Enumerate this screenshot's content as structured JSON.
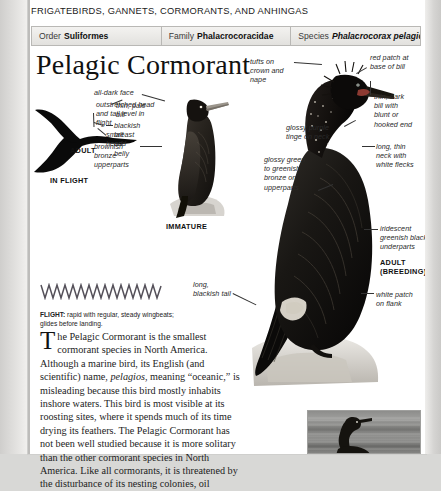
{
  "page": {
    "running_head": "FRIGATEBIRDS, GANNETS, CORMORANTS, AND ANHINGAS",
    "title": "Pelagic Cormorant"
  },
  "taxonomy": [
    {
      "label": "Order",
      "value": "Suliformes",
      "italic": false
    },
    {
      "label": "Family",
      "value": "Phalacrocoracidae",
      "italic": false
    },
    {
      "label": "Species",
      "value": "Phalacrocorax pelagicus",
      "italic": true
    }
  ],
  "callouts": {
    "outstretched": "outstretched head\nand tail level in\nflight",
    "small_head": "small\nhead",
    "brownish": "brownish\nbronze\nupperparts",
    "all_dark_face": "all-dark face",
    "thin_pale_bill": "thin, pale\nbill",
    "blackish_breast": "blackish\nbreast\nand\nbelly",
    "tufts": "tufts on\ncrown and\nnape",
    "red_patch": "red patch at\nbase of bill",
    "thin_dark_bill": "thin, dark\nbill with\nblunt or\nhooked end",
    "glossy_purple": "glossy purple\ntinge on neck",
    "long_thin_neck": "long, thin\nneck with\nwhite flecks",
    "glossy_green": "glossy green\nto greenish\nbronze on\nupperparts",
    "iridescent": "iridescent\ngreenish black\nunderparts",
    "white_patch": "white patch\non flank",
    "long_tail": "long,\nblackish tail"
  },
  "age_labels": {
    "adult": "ADULT",
    "in_flight": "IN FLIGHT",
    "immature": "IMMATURE",
    "adult_breeding_1": "ADULT",
    "adult_breeding_2": "(BREEDING)"
  },
  "flight": {
    "label": "FLIGHT:",
    "text": " rapid with regular, steady wingbeats;\nglides before landing."
  },
  "body_text": {
    "dropcap": "T",
    "paragraph_a": "he Pelagic Cormorant is the smallest cormorant species in North America. Although a marine bird, its English (and scientific) name, ",
    "paragraph_italic": "pelagios",
    "paragraph_b": ", meaning “oceanic,” is misleading because this bird mostly inhabits inshore waters. This bird is most visible at its roosting sites, where it spends much of its time drying its feathers. The Pelagic Cormorant has not been well studied because it is more solitary than the other cormorant species in North America. Like all cormorants, it is threatened by the disturbance of its nesting colonies, oil"
  },
  "colors": {
    "page_bg": "#e3e2e0",
    "sheet": "#ffffff",
    "tax_bar": "#eceae7",
    "ink": "#1a1a1a",
    "rule": "#b9b8b5"
  }
}
